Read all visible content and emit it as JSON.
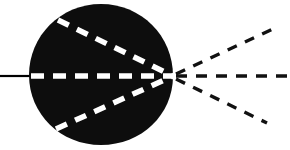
{
  "figure": {
    "name": "ray-convergence-diagram",
    "type": "optical-ray-diagram",
    "width": 290,
    "height": 150,
    "background_color": "#ffffff",
    "title": "",
    "caption": ""
  },
  "colors": {
    "background": "#ffffff",
    "body_fill": "#0d0d0d",
    "internal_ray": "#ffffff",
    "external_ray": "#111111",
    "incident_ray": "#000000"
  },
  "body": {
    "name": "dark-circular-body",
    "shape": "circle-tapered-right",
    "fill": "#0d0d0d",
    "center_x": 101,
    "center_y": 75,
    "radius_x": 72,
    "radius_y": 71,
    "left_edge_x": 29,
    "right_tip_x": 173,
    "top_edge_y": 4,
    "bottom_edge_y": 145
  },
  "focal_point": {
    "name": "convergence-point",
    "x": 173,
    "y": 76,
    "label": ""
  },
  "incident_ray": {
    "name": "incident-solid-ray",
    "style": "solid",
    "color": "#000000",
    "width": 2.2,
    "x1": 0,
    "y1": 76,
    "x2": 31,
    "y2": 76
  },
  "internal_rays": [
    {
      "name": "internal-ray-upper",
      "style": "dashed",
      "color": "#ffffff",
      "width": 5.5,
      "dash": "12 9",
      "x1": 58,
      "y1": 20,
      "x2": 173,
      "y2": 76
    },
    {
      "name": "internal-ray-axial",
      "style": "dashed",
      "color": "#ffffff",
      "width": 5.5,
      "dash": "13 9",
      "x1": 31,
      "y1": 76,
      "x2": 173,
      "y2": 76
    },
    {
      "name": "internal-ray-lower",
      "style": "dashed",
      "color": "#ffffff",
      "width": 5.5,
      "dash": "12 9",
      "x1": 56,
      "y1": 129,
      "x2": 173,
      "y2": 76
    }
  ],
  "external_rays": [
    {
      "name": "external-ray-upper",
      "style": "dashed",
      "color": "#111111",
      "width": 3.4,
      "dash": "10 9",
      "x1": 176,
      "y1": 74,
      "x2": 273,
      "y2": 29
    },
    {
      "name": "external-ray-axial",
      "style": "dashed",
      "color": "#111111",
      "width": 3.4,
      "dash": "11 9",
      "x1": 176,
      "y1": 76,
      "x2": 290,
      "y2": 76
    },
    {
      "name": "external-ray-lower",
      "style": "dashed",
      "color": "#111111",
      "width": 3.4,
      "dash": "10 9",
      "x1": 176,
      "y1": 79,
      "x2": 267,
      "y2": 123
    }
  ],
  "chart_data": {
    "type": "scatter",
    "xlabel": "",
    "ylabel": "",
    "xlim": [
      0,
      290
    ],
    "ylim": [
      0,
      150
    ],
    "grid": false,
    "legend": "none",
    "annotations": [],
    "series": [
      {
        "name": "incident-solid-ray",
        "style": "solid",
        "color": "#000000",
        "points": [
          [
            0,
            76
          ],
          [
            31,
            76
          ]
        ]
      },
      {
        "name": "internal-ray-upper",
        "style": "dashed-white",
        "color": "#ffffff",
        "points": [
          [
            58,
            20
          ],
          [
            173,
            76
          ]
        ]
      },
      {
        "name": "internal-ray-axial",
        "style": "dashed-white",
        "color": "#ffffff",
        "points": [
          [
            31,
            76
          ],
          [
            173,
            76
          ]
        ]
      },
      {
        "name": "internal-ray-lower",
        "style": "dashed-white",
        "color": "#ffffff",
        "points": [
          [
            56,
            129
          ],
          [
            173,
            76
          ]
        ]
      },
      {
        "name": "external-ray-upper",
        "style": "dashed-black",
        "color": "#111111",
        "points": [
          [
            176,
            74
          ],
          [
            273,
            29
          ]
        ]
      },
      {
        "name": "external-ray-axial",
        "style": "dashed-black",
        "color": "#111111",
        "points": [
          [
            176,
            76
          ],
          [
            290,
            76
          ]
        ]
      },
      {
        "name": "external-ray-lower",
        "style": "dashed-black",
        "color": "#111111",
        "points": [
          [
            176,
            79
          ],
          [
            267,
            123
          ]
        ]
      }
    ]
  }
}
